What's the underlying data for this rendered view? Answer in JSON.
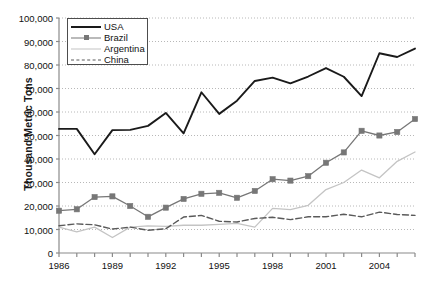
{
  "chart_data": {
    "type": "line",
    "title": "",
    "subtitle": "",
    "xlabel": "",
    "ylabel": "Thousand Metric Tons",
    "xlim": [
      1986,
      2006
    ],
    "ylim": [
      0,
      100000
    ],
    "ytick_labels": [
      "100,000",
      "90,000",
      "80,000",
      "70,000",
      "60,000",
      "50,000",
      "40,000",
      "30,000",
      "20,000",
      "10,000",
      "0"
    ],
    "ytick_values": [
      100000,
      90000,
      80000,
      70000,
      60000,
      50000,
      40000,
      30000,
      20000,
      10000,
      0
    ],
    "xtick_labels": [
      "1986",
      "1989",
      "1992",
      "1995",
      "1998",
      "2001",
      "2004"
    ],
    "xtick_values": [
      1986,
      1989,
      1992,
      1995,
      1998,
      2001,
      2004
    ],
    "x": [
      1986,
      1987,
      1988,
      1989,
      1990,
      1991,
      1992,
      1993,
      1994,
      1995,
      1996,
      1997,
      1998,
      1999,
      2000,
      2001,
      2002,
      2003,
      2004,
      2005,
      2006
    ],
    "grid": true,
    "grid_style": "dotted-horizontal",
    "legend_position": "top-left",
    "series": [
      {
        "name": "USA",
        "color": "#1a1a1a",
        "style": "solid",
        "width": 1.9,
        "marker": "none",
        "values": [
          52800,
          52800,
          42000,
          52300,
          52400,
          54100,
          59600,
          50900,
          68400,
          59200,
          64800,
          73200,
          74600,
          72200,
          75100,
          78700,
          75000,
          66800,
          85000,
          83400,
          87000
        ]
      },
      {
        "name": "Brazil",
        "color": "#777777",
        "style": "solid",
        "width": 1.3,
        "marker": "square",
        "values": [
          18000,
          18600,
          23800,
          24100,
          20000,
          15400,
          19300,
          23000,
          25200,
          25600,
          23500,
          26400,
          31400,
          30800,
          32700,
          38400,
          42800,
          52000,
          50000,
          51500,
          57000
        ]
      },
      {
        "name": "Argentina",
        "color": "#c4c4c4",
        "style": "solid",
        "width": 1.3,
        "marker": "none",
        "values": [
          11000,
          9000,
          11000,
          6600,
          11000,
          11500,
          11300,
          11800,
          11800,
          12200,
          12600,
          11000,
          19000,
          18500,
          20300,
          27000,
          30000,
          35300,
          32000,
          39000,
          43000
        ]
      },
      {
        "name": "China",
        "color": "#5a5a5a",
        "style": "dashed",
        "width": 1.4,
        "marker": "none",
        "values": [
          11600,
          12400,
          12000,
          10200,
          11000,
          9700,
          10300,
          15300,
          16000,
          13500,
          13200,
          14700,
          15200,
          14200,
          15400,
          15400,
          16500,
          15400,
          17400,
          16400,
          16000
        ]
      }
    ]
  },
  "legend": {
    "entries": [
      {
        "label": "USA"
      },
      {
        "label": "Brazil"
      },
      {
        "label": "Argentina"
      },
      {
        "label": "China"
      }
    ]
  }
}
